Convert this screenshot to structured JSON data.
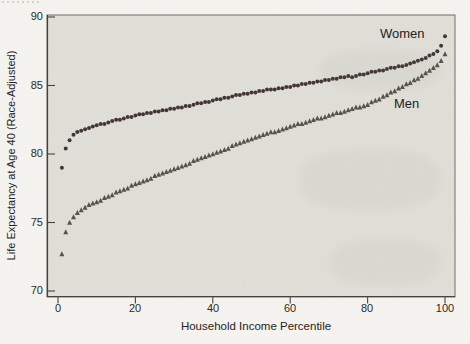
{
  "figure": {
    "y_axis_label": "Life Expectancy at Age 40 (Race-Adjusted)",
    "x_axis_label": "Household Income Percentile",
    "y_ticks": [
      "90",
      "85",
      "80",
      "75",
      "70"
    ],
    "x_ticks": [
      "0",
      "20",
      "40",
      "60",
      "80",
      "100"
    ],
    "series_labels": {
      "women": "Women",
      "men": "Men"
    }
  },
  "colors": {
    "page_bg": "#f7f6f2",
    "plot_bg": "#e1e1da",
    "frame": "#6e6e66",
    "axis": "#44443f",
    "text": "#26231f",
    "women_marker": "#443638",
    "men_marker": "#56534b"
  },
  "chart_data": {
    "type": "scatter",
    "title": "",
    "xlabel": "Household Income Percentile",
    "ylabel": "Life Expectancy at Age 40 (Race-Adjusted)",
    "xlim": [
      0,
      100
    ],
    "ylim": [
      70,
      90
    ],
    "grid": false,
    "legend_position": "inline-annotations",
    "x": [
      1,
      2,
      3,
      4,
      5,
      6,
      7,
      8,
      9,
      10,
      11,
      12,
      13,
      14,
      15,
      16,
      17,
      18,
      19,
      20,
      21,
      22,
      23,
      24,
      25,
      26,
      27,
      28,
      29,
      30,
      31,
      32,
      33,
      34,
      35,
      36,
      37,
      38,
      39,
      40,
      41,
      42,
      43,
      44,
      45,
      46,
      47,
      48,
      49,
      50,
      51,
      52,
      53,
      54,
      55,
      56,
      57,
      58,
      59,
      60,
      61,
      62,
      63,
      64,
      65,
      66,
      67,
      68,
      69,
      70,
      71,
      72,
      73,
      74,
      75,
      76,
      77,
      78,
      79,
      80,
      81,
      82,
      83,
      84,
      85,
      86,
      87,
      88,
      89,
      90,
      91,
      92,
      93,
      94,
      95,
      96,
      97,
      98,
      99,
      100
    ],
    "series": [
      {
        "name": "Women",
        "marker": "circle",
        "color": "#443638",
        "values": [
          79.0,
          80.4,
          81.0,
          81.4,
          81.6,
          81.7,
          81.8,
          81.9,
          82.0,
          82.1,
          82.2,
          82.2,
          82.3,
          82.4,
          82.5,
          82.5,
          82.6,
          82.7,
          82.7,
          82.8,
          82.9,
          82.9,
          83.0,
          83.0,
          83.1,
          83.1,
          83.2,
          83.2,
          83.3,
          83.3,
          83.4,
          83.4,
          83.5,
          83.5,
          83.6,
          83.7,
          83.7,
          83.8,
          83.8,
          83.9,
          84.0,
          84.0,
          84.1,
          84.1,
          84.2,
          84.3,
          84.3,
          84.4,
          84.4,
          84.5,
          84.5,
          84.6,
          84.6,
          84.7,
          84.7,
          84.7,
          84.8,
          84.8,
          84.9,
          84.9,
          85.0,
          85.0,
          85.1,
          85.1,
          85.2,
          85.2,
          85.3,
          85.3,
          85.4,
          85.4,
          85.5,
          85.5,
          85.6,
          85.6,
          85.7,
          85.6,
          85.7,
          85.8,
          85.8,
          85.9,
          86.0,
          86.0,
          86.1,
          86.1,
          86.2,
          86.3,
          86.3,
          86.4,
          86.4,
          86.5,
          86.6,
          86.7,
          86.8,
          86.9,
          87.0,
          87.2,
          87.3,
          87.5,
          87.9,
          88.6
        ]
      },
      {
        "name": "Men",
        "marker": "triangle",
        "color": "#56534b",
        "values": [
          72.7,
          74.3,
          75.0,
          75.4,
          75.7,
          75.9,
          76.1,
          76.3,
          76.4,
          76.5,
          76.6,
          76.8,
          76.9,
          77.0,
          77.2,
          77.3,
          77.4,
          77.5,
          77.7,
          77.8,
          77.9,
          78.0,
          78.1,
          78.2,
          78.4,
          78.5,
          78.6,
          78.7,
          78.8,
          78.9,
          79.0,
          79.1,
          79.2,
          79.3,
          79.5,
          79.6,
          79.7,
          79.8,
          79.9,
          80.0,
          80.1,
          80.2,
          80.3,
          80.4,
          80.6,
          80.7,
          80.8,
          80.9,
          81.0,
          81.1,
          81.2,
          81.3,
          81.4,
          81.5,
          81.6,
          81.6,
          81.7,
          81.8,
          81.9,
          82.0,
          82.1,
          82.2,
          82.2,
          82.3,
          82.4,
          82.5,
          82.6,
          82.6,
          82.7,
          82.8,
          82.9,
          83.0,
          83.0,
          83.1,
          83.2,
          83.3,
          83.4,
          83.4,
          83.5,
          83.6,
          83.8,
          83.9,
          84.0,
          84.2,
          84.3,
          84.5,
          84.6,
          84.8,
          84.9,
          85.1,
          85.2,
          85.4,
          85.5,
          85.7,
          85.9,
          86.1,
          86.3,
          86.5,
          86.8,
          87.3
        ]
      }
    ]
  }
}
